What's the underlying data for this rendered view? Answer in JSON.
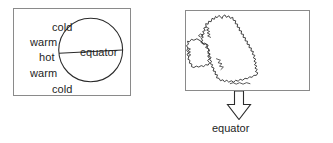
{
  "diagram": {
    "background_color": "#ffffff",
    "ink_color": "#2b2b2b",
    "panel_border_color": "#8a8a8a"
  },
  "globe_panel": {
    "name": "globe-panel",
    "equator_label": "equator",
    "zone_labels": {
      "north_cold": "cold",
      "north_warm": "warm",
      "hot": "hot",
      "south_warm": "warm",
      "south_cold": "cold"
    },
    "zone_order": [
      "cold",
      "warm",
      "hot",
      "warm",
      "cold"
    ]
  },
  "map_panel": {
    "name": "british-isles-panel",
    "map_shape": "british-isles-outline",
    "colder_label": "colder",
    "warmer_label": "warmer"
  },
  "arrow": {
    "name": "down-arrow",
    "direction": "down",
    "caption": "equator"
  }
}
